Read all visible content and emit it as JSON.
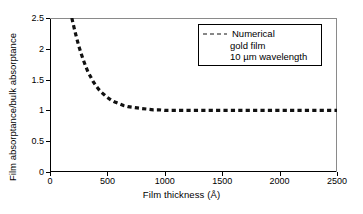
{
  "chart_data": {
    "type": "line",
    "title": "",
    "xlabel": "Film thickness (Å)",
    "ylabel": "Film absorptance/bulk absorptance",
    "xlim": [
      0,
      2500
    ],
    "ylim": [
      0,
      2.5
    ],
    "xticks": [
      0,
      500,
      1000,
      1500,
      2000,
      2500
    ],
    "xticklabels": [
      "0",
      "500",
      "1000",
      "1500",
      "2000",
      "2500"
    ],
    "yticks": [
      0,
      0.5,
      1,
      1.5,
      2,
      2.5
    ],
    "yticklabels": [
      "0",
      "0.5",
      "1",
      "1.5",
      "2",
      "2.5"
    ],
    "grid": false,
    "legend_position": "upper right",
    "series": [
      {
        "name": "Numerical",
        "style": "dashed",
        "color": "#111111",
        "x": [
          190,
          200,
          215,
          230,
          250,
          270,
          290,
          310,
          330,
          350,
          375,
          400,
          425,
          450,
          475,
          500,
          530,
          560,
          600,
          640,
          680,
          720,
          760,
          800,
          850,
          900,
          950,
          1000,
          1100,
          1200,
          1300,
          1400,
          1500,
          1600,
          1700,
          1800,
          1900,
          2000,
          2100,
          2200,
          2300,
          2400,
          2500
        ],
        "y": [
          2.5,
          2.42,
          2.3,
          2.19,
          2.05,
          1.93,
          1.82,
          1.72,
          1.63,
          1.56,
          1.47,
          1.4,
          1.34,
          1.29,
          1.25,
          1.21,
          1.17,
          1.14,
          1.11,
          1.08,
          1.06,
          1.05,
          1.04,
          1.03,
          1.02,
          1.01,
          1.01,
          1.0,
          1.0,
          1.0,
          1.0,
          1.0,
          1.0,
          1.0,
          1.0,
          1.0,
          1.0,
          1.0,
          1.0,
          1.0,
          1.0,
          1.0,
          1.0
        ]
      }
    ]
  },
  "legend": {
    "sample_style": "dashed",
    "lines": [
      "Numerical",
      "gold film",
      "10 µm wavelength"
    ]
  },
  "colors": {
    "curve": "#111111",
    "axis": "#000000",
    "frame_light": "#8a8a8a",
    "background": "#ffffff"
  }
}
